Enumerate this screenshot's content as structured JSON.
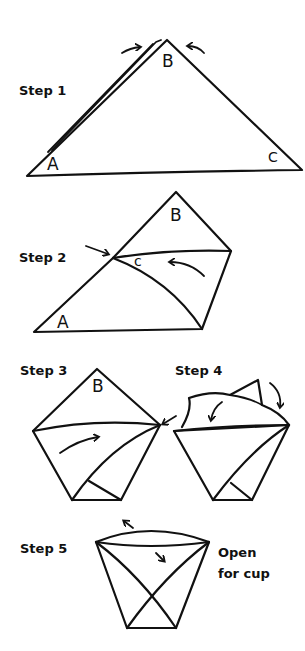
{
  "steps": [
    {
      "label": "Step 1",
      "points": {
        "a": "A",
        "b": "B",
        "c": "C"
      }
    },
    {
      "label": "Step 2",
      "points": {
        "a": "A",
        "b": "B",
        "c": "c"
      }
    },
    {
      "label": "Step 3",
      "points": {
        "b": "B"
      }
    },
    {
      "label": "Step 4"
    },
    {
      "label": "Step 5",
      "note_line1": "Open",
      "note_line2": "for cup"
    }
  ],
  "colors": {
    "ink": "#111111",
    "background": "#ffffff"
  }
}
